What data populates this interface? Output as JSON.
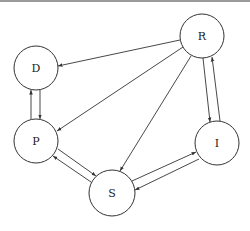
{
  "diagram": {
    "type": "directed-graph",
    "nodes": [
      {
        "id": "D",
        "label": "D",
        "cx": 36,
        "cy": 68,
        "r": 22
      },
      {
        "id": "R",
        "label": "R",
        "cx": 202,
        "cy": 36,
        "r": 22
      },
      {
        "id": "P",
        "label": "P",
        "cx": 36,
        "cy": 141,
        "r": 22
      },
      {
        "id": "I",
        "label": "I",
        "cx": 217,
        "cy": 143,
        "r": 22
      },
      {
        "id": "S",
        "label": "S",
        "cx": 112,
        "cy": 193,
        "r": 23
      }
    ],
    "edges": [
      {
        "from": "R",
        "to": "D"
      },
      {
        "from": "R",
        "to": "P"
      },
      {
        "from": "R",
        "to": "S"
      },
      {
        "from": "P",
        "to": "D"
      },
      {
        "from": "D",
        "to": "P"
      },
      {
        "from": "R",
        "to": "I"
      },
      {
        "from": "I",
        "to": "R"
      },
      {
        "from": "P",
        "to": "S"
      },
      {
        "from": "S",
        "to": "P"
      },
      {
        "from": "S",
        "to": "I"
      },
      {
        "from": "I",
        "to": "S"
      }
    ]
  }
}
